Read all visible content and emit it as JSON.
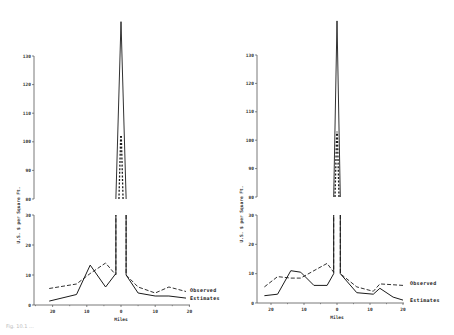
{
  "caption": "Fig. 10.1 ...",
  "chart_data": [
    {
      "type": "line",
      "panel": "left",
      "title": "",
      "xlabel": "Miles",
      "ylabel": "U.S. $ per Square Ft.",
      "x_ticks": [
        "20",
        "10",
        "0",
        "10",
        "20"
      ],
      "y_ticks_upper": [
        "80",
        "90",
        "100",
        "110",
        "120",
        "130"
      ],
      "y_ticks_lower": [
        "0",
        "10",
        "20",
        "30"
      ],
      "ylim_upper": [
        80,
        130
      ],
      "ylim_lower": [
        0,
        30
      ],
      "broken_axis": true,
      "grid": false,
      "legend_position": "right-inline",
      "series": [
        {
          "name": "Observed",
          "style": "dashed",
          "points": [
            [
              -21,
              5.5
            ],
            [
              -13,
              7
            ],
            [
              -9,
              10.5
            ],
            [
              -4.5,
              14
            ],
            [
              -1.5,
              10
            ],
            [
              0,
              102
            ],
            [
              1.5,
              10
            ],
            [
              5,
              6
            ],
            [
              10,
              4
            ],
            [
              14,
              6
            ],
            [
              19,
              4.5
            ]
          ]
        },
        {
          "name": "Estimates",
          "style": "solid",
          "points": [
            [
              -21,
              1.3
            ],
            [
              -13,
              3.5
            ],
            [
              -9,
              13.3
            ],
            [
              -4.5,
              6
            ],
            [
              -1.5,
              10.5
            ],
            [
              0,
              142
            ],
            [
              1.5,
              10
            ],
            [
              5,
              4
            ],
            [
              10,
              3
            ],
            [
              14,
              3
            ],
            [
              19,
              2.3
            ]
          ]
        }
      ]
    },
    {
      "type": "line",
      "panel": "right",
      "title": "",
      "xlabel": "Miles",
      "ylabel": "U.S. $ per Square Ft.",
      "x_ticks": [
        "20",
        "10",
        "0",
        "10",
        "20"
      ],
      "y_ticks_upper": [
        "80",
        "90",
        "100",
        "110",
        "120",
        "130"
      ],
      "y_ticks_lower": [
        "0",
        "10",
        "20",
        "30"
      ],
      "ylim_upper": [
        80,
        130
      ],
      "ylim_lower": [
        0,
        30
      ],
      "broken_axis": true,
      "grid": false,
      "legend_position": "right-inline",
      "series": [
        {
          "name": "Observed",
          "style": "dashed",
          "points": [
            [
              -22,
              5.5
            ],
            [
              -18,
              9
            ],
            [
              -14,
              8.5
            ],
            [
              -11,
              8.5
            ],
            [
              -7,
              11
            ],
            [
              -3,
              13.5
            ],
            [
              -1,
              10.5
            ],
            [
              0,
              103
            ],
            [
              1,
              10
            ],
            [
              6,
              5.5
            ],
            [
              11,
              4
            ],
            [
              13,
              6.5
            ],
            [
              20,
              6
            ]
          ]
        },
        {
          "name": "Estimates",
          "style": "solid",
          "points": [
            [
              -22,
              2.5
            ],
            [
              -18,
              3
            ],
            [
              -14,
              11
            ],
            [
              -11,
              10.5
            ],
            [
              -7,
              6
            ],
            [
              -3,
              6
            ],
            [
              -1,
              10
            ],
            [
              0,
              142
            ],
            [
              1,
              10
            ],
            [
              6,
              3.5
            ],
            [
              11,
              3
            ],
            [
              13,
              5
            ],
            [
              17,
              2
            ],
            [
              20,
              1
            ]
          ]
        }
      ]
    }
  ],
  "panels": [
    {
      "id": "left",
      "axis_x": 34,
      "x0": 121,
      "px_per_mile": 3.42,
      "upper_top_y": 56,
      "upper_bottom_y": 199,
      "lower_top_y": 215,
      "lower_bottom_y": 305,
      "xaxis_left": 34,
      "xaxis_right": 190,
      "legend_x": 190
    },
    {
      "id": "right",
      "axis_x": 257,
      "x0": 337,
      "px_per_mile": 3.3,
      "upper_top_y": 55,
      "upper_bottom_y": 197,
      "lower_top_y": 215,
      "lower_bottom_y": 303,
      "xaxis_left": 257,
      "xaxis_right": 404,
      "legend_x": 410
    }
  ]
}
